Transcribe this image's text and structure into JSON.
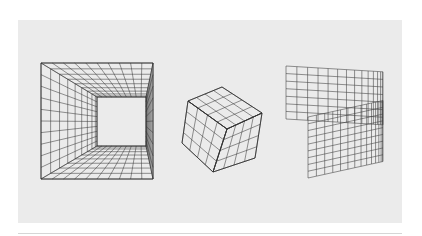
{
  "colors": {
    "page_bg": "#ffffff",
    "panel_bg": "#ebebeb",
    "line": "#3a3a3a",
    "rule": "#d6d6d6"
  },
  "figures": [
    {
      "name": "tunnel-box",
      "description": "Interior of a box viewed in one-point perspective with gridded walls",
      "outer": {
        "x0": 41,
        "y0": 63,
        "x1": 153,
        "y1": 179
      },
      "inner": {
        "x0": 97,
        "y0": 97,
        "x1": 146,
        "y1": 146
      },
      "divisions": 10,
      "depth_steps": 9
    },
    {
      "name": "cube",
      "description": "Cube with three visible faces, each subdivided 4x4",
      "grid": 4,
      "vertices": {
        "top_back": [
          222,
          87
        ],
        "top_left": [
          188,
          101
        ],
        "top_right": [
          262,
          113
        ],
        "center": [
          227,
          129
        ],
        "bottom_left": [
          182,
          143
        ],
        "bottom_right": [
          255,
          158
        ],
        "bottom": [
          213,
          172
        ]
      }
    },
    {
      "name": "cylinder-strip",
      "description": "Partial cylinder with gridded surface, front half lower and offset",
      "back": {
        "x0": 286,
        "x1": 383,
        "top": 66,
        "bottom": 119
      },
      "front": {
        "x0": 308,
        "x1": 383,
        "top": 117,
        "bottom": 178
      },
      "cols": 22,
      "rows": 14
    }
  ]
}
